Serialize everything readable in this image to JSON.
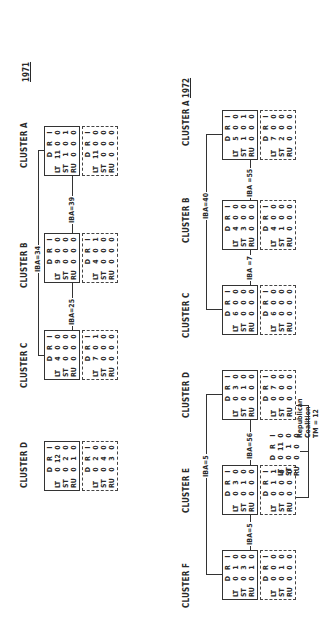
{
  "cols": [
    "D",
    "R",
    "I"
  ],
  "rows": [
    "LT",
    "ST",
    "RU"
  ],
  "y1971": {
    "year": "1971",
    "clusters": {
      "A": {
        "label": "CLUSTER A",
        "solid": [
          [
            11,
            0,
            0
          ],
          [
            1,
            0,
            1
          ],
          [
            0,
            0,
            0
          ]
        ],
        "dashed": [
          [
            11,
            0,
            0
          ],
          [
            0,
            0,
            0
          ],
          [
            0,
            0,
            0
          ]
        ]
      },
      "B": {
        "label": "CLUSTER B",
        "solid": [
          [
            9,
            0,
            0
          ],
          [
            0,
            0,
            0
          ],
          [
            0,
            0,
            0
          ]
        ],
        "dashed": [
          [
            4,
            0,
            1
          ],
          [
            0,
            0,
            0
          ],
          [
            0,
            0,
            0
          ]
        ]
      },
      "C": {
        "label": "CLUSTER C",
        "solid": [
          [
            4,
            0,
            0
          ],
          [
            0,
            0,
            0
          ],
          [
            0,
            0,
            0
          ]
        ],
        "dashed": [
          [
            7,
            0,
            1
          ],
          [
            0,
            0,
            0
          ],
          [
            0,
            0,
            0
          ]
        ]
      },
      "D": {
        "label": "CLUSTER  D",
        "solid": [
          [
            0,
            12,
            0
          ],
          [
            0,
            2,
            0
          ],
          [
            0,
            1,
            0
          ]
        ],
        "dashed": [
          [
            0,
            2,
            0
          ],
          [
            0,
            4,
            0
          ],
          [
            0,
            3,
            0
          ]
        ]
      }
    },
    "links": {
      "ab": "IBA=39",
      "bc": "IBA=25",
      "top": "IBA=34"
    }
  },
  "y1972": {
    "year": "1972",
    "clusters": {
      "A": {
        "label": "CLUSTER A",
        "solid": [
          [
            5,
            0,
            0
          ],
          [
            1,
            0,
            1
          ],
          [
            0,
            0,
            0
          ]
        ],
        "dashed": [
          [
            7,
            0,
            0
          ],
          [
            2,
            0,
            0
          ],
          [
            0,
            0,
            0
          ]
        ]
      },
      "B": {
        "label": "CLUSTER B",
        "solid": [
          [
            4,
            0,
            0
          ],
          [
            3,
            0,
            0
          ],
          [
            0,
            0,
            0
          ]
        ],
        "dashed": [
          [
            4,
            0,
            0
          ],
          [
            1,
            0,
            0
          ],
          [
            0,
            0,
            0
          ]
        ]
      },
      "C": {
        "label": "CLUSTER C",
        "solid": [
          [
            6,
            0,
            0
          ],
          [
            0,
            0,
            0
          ],
          [
            0,
            0,
            0
          ]
        ],
        "dashed": [
          [
            6,
            0,
            0
          ],
          [
            0,
            0,
            0
          ],
          [
            0,
            0,
            0
          ]
        ]
      },
      "D": {
        "label": "CLUSTER D",
        "solid": [
          [
            0,
            3,
            0
          ],
          [
            0,
            1,
            0
          ],
          [
            0,
            0,
            0
          ]
        ],
        "dashed": [
          [
            0,
            7,
            0
          ],
          [
            0,
            0,
            0
          ],
          [
            0,
            0,
            0
          ]
        ]
      },
      "E": {
        "label": "CLUSTER E",
        "solid": [
          [
            0,
            3,
            0
          ],
          [
            0,
            1,
            0
          ],
          [
            0,
            0,
            0
          ]
        ],
        "dashed": [
          [
            0,
            1,
            1
          ],
          [
            0,
            0,
            0
          ],
          [
            0,
            0,
            0
          ]
        ]
      },
      "F": {
        "label": "CLUSTER F",
        "solid": [
          [
            0,
            1,
            0
          ],
          [
            0,
            3,
            0
          ],
          [
            0,
            1,
            0
          ]
        ],
        "dashed": [
          [
            0,
            0,
            0
          ],
          [
            0,
            1,
            0
          ],
          [
            0,
            0,
            0
          ]
        ]
      }
    },
    "links": {
      "ab": "IBA =55",
      "bc": "IBA =7",
      "top_abc": "IBA=40",
      "de": "IBA=56",
      "ef": "IBA=5",
      "top_def": "IBA=5"
    },
    "coalition": {
      "title1": "Republican",
      "title2": "Coalition",
      "tm": "TM = 12",
      "matrix": [
        [
          0,
          11,
          0
        ],
        [
          0,
          1,
          0
        ],
        [
          0,
          0,
          0
        ]
      ]
    }
  }
}
